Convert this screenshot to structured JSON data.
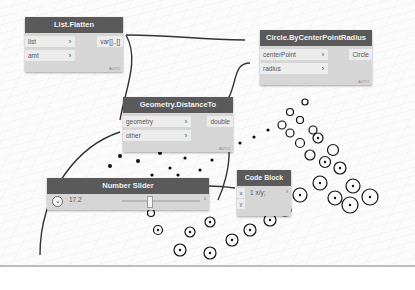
{
  "nodes": {
    "list_flatten": {
      "title": "List.Flatten",
      "inputs": [
        "list",
        "amt"
      ],
      "output": "var[]..[]",
      "lacing": "AUTO"
    },
    "circle": {
      "title": "Circle.ByCenterPointRadius",
      "inputs": [
        "centerPoint",
        "radius"
      ],
      "output": "Circle",
      "lacing": "AUTO"
    },
    "distance": {
      "title": "Geometry.DistanceTo",
      "inputs": [
        "geometry",
        "other"
      ],
      "output": "double",
      "lacing": "AUTO"
    },
    "slider": {
      "title": "Number Slider",
      "value": "17.2"
    },
    "code_block": {
      "title": "Code Block",
      "code": "1 x/y;",
      "inputs": [
        "x",
        "y"
      ]
    }
  },
  "icons": {
    "chevron": "›",
    "expand": "⌄"
  }
}
